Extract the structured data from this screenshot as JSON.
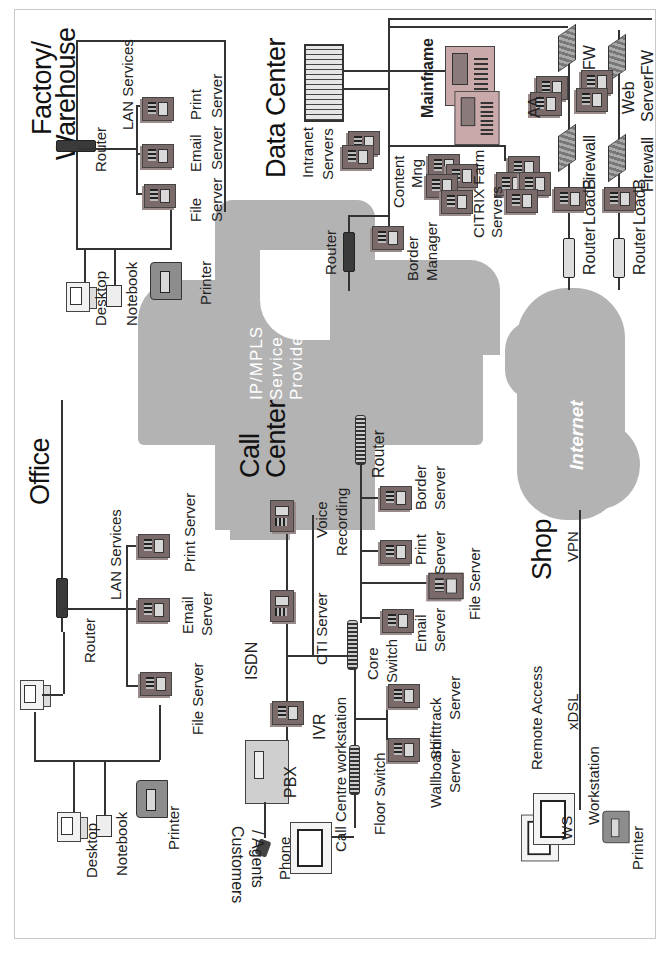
{
  "diagram": {
    "orientation": "rotated-90-ccw",
    "clouds": {
      "service_provider": {
        "label_line1": "IP/MPLS",
        "label_line2": "Service",
        "label_line3": "Provider",
        "color": "#b3b3b3"
      },
      "internet": {
        "label": "Internet",
        "color": "#b3b3b3"
      }
    },
    "factory": {
      "title_line1": "Factory/",
      "title_line2": "Warehouse",
      "router": "Router",
      "lan_services": "LAN Services",
      "file_server_1": "File",
      "file_server_2": "Server",
      "email_server_1": "Email",
      "email_server_2": "Server",
      "print_server_1": "Print",
      "print_server_2": "Server",
      "desktop": "Desktop",
      "notebook": "Notebook",
      "printer": "Printer"
    },
    "data_center": {
      "title": "Data Center",
      "intranet_1": "Intranet",
      "intranet_2": "Servers",
      "mainframe": "Mainframe",
      "content_1": "Content",
      "content_2": "Mng",
      "border_1": "Border",
      "border_2": "Manager",
      "citrix_1": "CITRIX Farm",
      "citrix_2": "Servers",
      "router": "Router",
      "aa": "AA",
      "fw": "FW",
      "firewall_a": "Firewall",
      "loadb_a": "LoadB",
      "router_a": "Router",
      "web_1": "Web",
      "web_2": "ServerFW",
      "firewall_b": "Firewall",
      "loadb_b": "LoadB",
      "router_b": "Router"
    },
    "office": {
      "title": "Office",
      "router": "Router",
      "lan_services": "LAN Services",
      "print_server": "Print  Server",
      "email_1": "Email",
      "email_2": "Server",
      "file_server": "File Server",
      "desktop": "Desktop",
      "notebook": "Notebook",
      "printer": "Printer"
    },
    "call_center": {
      "title_line1": "Call",
      "title_line2": "Center",
      "isdn": "ISDN",
      "cti_server": "CTI Server",
      "voice_1": "Voice",
      "voice_2": "Recording",
      "router": "Router",
      "border_1": "Border",
      "border_2": "Server",
      "print_1": "Print",
      "print_2": "Server",
      "file_server": "File Server",
      "email_1": "Email",
      "email_2": "Server",
      "core_1": "Core",
      "core_2": "Switch",
      "ivr": "IVR",
      "pbx": "PBX",
      "phone": "Phone",
      "workstation": "Call Centre workstation",
      "floor_switch": "Floor Switch",
      "wallboard_1": "Wallboard",
      "wallboard_2": "Server",
      "shifttrack_1": "Shifttrack",
      "shifttrack_2": "Server",
      "customers_1": "Customers",
      "customers_2": "/ Agents"
    },
    "shop": {
      "title": "Shop",
      "vpn": "VPN",
      "remote_access": "Remote Access",
      "xdsl": "xDSL",
      "workstation": "Workstation",
      "ws": "WS",
      "printer": "Printer"
    }
  }
}
